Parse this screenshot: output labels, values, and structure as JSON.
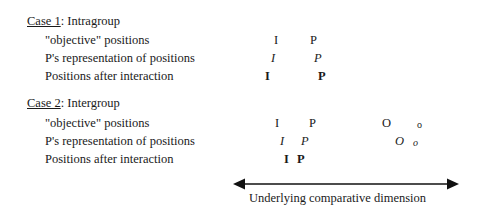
{
  "case1": {
    "title_underlined": "Case 1",
    "title_rest": ": Intragroup",
    "rows": [
      {
        "label": "\"objective\" positions",
        "marks": [
          {
            "text": "I",
            "x": 274
          },
          {
            "text": "P",
            "x": 310
          }
        ]
      },
      {
        "label": "P's representation of positions",
        "marks": [
          {
            "text": "I",
            "x": 271
          },
          {
            "text": "P",
            "x": 314
          }
        ]
      },
      {
        "label": "Positions after interaction",
        "marks": [
          {
            "text": "I",
            "x": 265
          },
          {
            "text": "P",
            "x": 318
          }
        ]
      }
    ]
  },
  "case2": {
    "title_underlined": "Case 2",
    "title_rest": ": Intergroup",
    "rows": [
      {
        "label": "\"objective\" positions",
        "marks": [
          {
            "text": "I",
            "x": 275
          },
          {
            "text": "P",
            "x": 309
          },
          {
            "text": "O",
            "x": 382
          },
          {
            "text": "o",
            "x": 417
          }
        ]
      },
      {
        "label": "P's representation of positions",
        "marks": [
          {
            "text": "I",
            "x": 280
          },
          {
            "text": "P",
            "x": 301
          },
          {
            "text": "O",
            "x": 395
          },
          {
            "text": "o",
            "x": 413
          }
        ]
      },
      {
        "label": "Positions after interaction",
        "marks": [
          {
            "text": "I",
            "x": 284
          },
          {
            "text": "P",
            "x": 297
          }
        ]
      }
    ]
  },
  "axis": {
    "caption": "Underlying comparative dimension"
  }
}
